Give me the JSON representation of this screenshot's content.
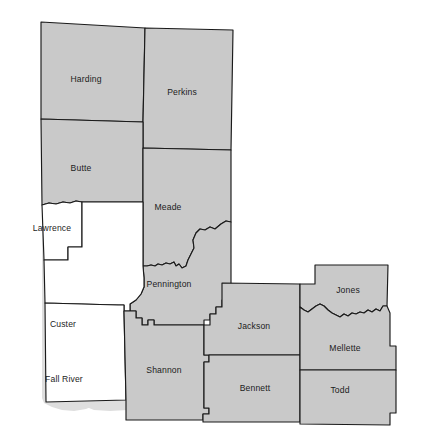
{
  "map": {
    "title": "West River South Dakota County Map",
    "region": "West River, South Dakota",
    "fill_gray": "#c9c9c9",
    "fill_white": "#ffffff",
    "shade_color": "#dedede",
    "border_color": "#1a1a1a",
    "background": "#ffffff"
  },
  "counties": [
    {
      "id": "harding",
      "label": "Harding",
      "fill": "gray",
      "label_x": 86,
      "label_y": 80
    },
    {
      "id": "perkins",
      "label": "Perkins",
      "fill": "gray",
      "label_x": 182,
      "label_y": 93
    },
    {
      "id": "butte",
      "label": "Butte",
      "fill": "gray",
      "label_x": 81,
      "label_y": 169
    },
    {
      "id": "meade",
      "label": "Meade",
      "fill": "gray",
      "label_x": 168,
      "label_y": 208
    },
    {
      "id": "lawrence",
      "label": "Lawrence",
      "fill": "white",
      "label_x": 52,
      "label_y": 229
    },
    {
      "id": "pennington",
      "label": "Pennington",
      "fill": "gray",
      "label_x": 169,
      "label_y": 285
    },
    {
      "id": "custer",
      "label": "Custer",
      "fill": "white",
      "label_x": 63,
      "label_y": 325
    },
    {
      "id": "fall-river",
      "label": "Fall River",
      "fill": "white",
      "label_x": 64,
      "label_y": 380
    },
    {
      "id": "shannon",
      "label": "Shannon",
      "fill": "gray",
      "label_x": 164,
      "label_y": 371
    },
    {
      "id": "jackson",
      "label": "Jackson",
      "fill": "gray",
      "label_x": 254,
      "label_y": 327
    },
    {
      "id": "bennett",
      "label": "Bennett",
      "fill": "gray",
      "label_x": 255,
      "label_y": 389
    },
    {
      "id": "jones",
      "label": "Jones",
      "fill": "gray",
      "label_x": 348,
      "label_y": 291
    },
    {
      "id": "mellette",
      "label": "Mellette",
      "fill": "gray",
      "label_x": 345,
      "label_y": 349
    },
    {
      "id": "todd",
      "label": "Todd",
      "fill": "gray",
      "label_x": 340,
      "label_y": 391
    }
  ]
}
